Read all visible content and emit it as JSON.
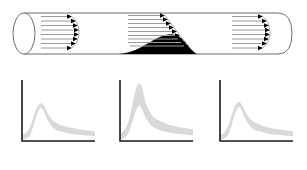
{
  "figure": {
    "title": "",
    "vessel": {
      "name": "vessel-pipe",
      "left_end_style": "open-ellipse",
      "right_end_style": "rounded-cap",
      "outline_color": "#6b6b6b",
      "stenosis": {
        "name": "stenosis-plaque",
        "color": "#000000",
        "label": ""
      },
      "flow_profiles": [
        {
          "name": "velocity-profile-proximal",
          "label": "",
          "arrow_count": 8,
          "shape": "plug",
          "arrow_lengths": [
            26,
            30,
            32,
            33,
            33,
            32,
            30,
            26
          ],
          "color": "#9a9a9a",
          "head_color": "#000000"
        },
        {
          "name": "velocity-profile-stenosis",
          "label": "",
          "arrow_count": 9,
          "shape": "skewed-accelerated",
          "arrow_lengths": [
            32,
            34,
            37,
            40,
            43,
            46,
            49,
            52,
            54
          ],
          "color": "#9a9a9a",
          "head_color": "#000000"
        },
        {
          "name": "velocity-profile-distal",
          "label": "",
          "arrow_count": 8,
          "shape": "plug",
          "arrow_lengths": [
            27,
            30,
            32,
            33,
            33,
            32,
            30,
            27
          ],
          "color": "#9a9a9a",
          "head_color": "#000000"
        }
      ]
    }
  },
  "chart_data": [
    {
      "type": "area",
      "name": "doppler-waveform-proximal",
      "title": "",
      "xlabel": "",
      "ylabel": "",
      "xlim": [
        0,
        100
      ],
      "ylim": [
        0,
        100
      ],
      "grid": false,
      "legend": "none",
      "band_color": "#d9d9d9",
      "axis_color": "#1a1a1a",
      "peak_value": 62,
      "peak_x": 26,
      "x": [
        0,
        6,
        12,
        18,
        22,
        26,
        30,
        36,
        44,
        54,
        66,
        80,
        100
      ],
      "upper": [
        10,
        14,
        26,
        48,
        58,
        62,
        58,
        44,
        32,
        26,
        22,
        19,
        16
      ],
      "lower": [
        2,
        4,
        12,
        34,
        48,
        55,
        48,
        32,
        20,
        15,
        12,
        10,
        8
      ]
    },
    {
      "type": "area",
      "name": "doppler-waveform-stenosis",
      "title": "",
      "xlabel": "",
      "ylabel": "",
      "xlim": [
        0,
        100
      ],
      "ylim": [
        0,
        100
      ],
      "grid": false,
      "legend": "none",
      "band_color": "#d9d9d9",
      "axis_color": "#1a1a1a",
      "peak_value": 94,
      "peak_x": 28,
      "x": [
        0,
        6,
        12,
        18,
        22,
        26,
        30,
        36,
        44,
        54,
        66,
        80,
        100
      ],
      "upper": [
        12,
        18,
        34,
        66,
        86,
        94,
        88,
        60,
        42,
        33,
        27,
        23,
        19
      ],
      "lower": [
        2,
        5,
        14,
        36,
        50,
        58,
        52,
        36,
        24,
        18,
        14,
        12,
        9
      ]
    },
    {
      "type": "area",
      "name": "doppler-waveform-distal",
      "title": "",
      "xlabel": "",
      "ylabel": "",
      "xlim": [
        0,
        100
      ],
      "ylim": [
        0,
        100
      ],
      "grid": false,
      "legend": "none",
      "band_color": "#d9d9d9",
      "axis_color": "#1a1a1a",
      "peak_value": 64,
      "peak_x": 27,
      "x": [
        0,
        6,
        12,
        18,
        22,
        26,
        30,
        36,
        44,
        54,
        66,
        80,
        100
      ],
      "upper": [
        10,
        14,
        27,
        50,
        60,
        64,
        59,
        45,
        33,
        27,
        22,
        19,
        16
      ],
      "lower": [
        2,
        4,
        12,
        34,
        49,
        56,
        49,
        33,
        21,
        16,
        12,
        10,
        8
      ]
    }
  ]
}
